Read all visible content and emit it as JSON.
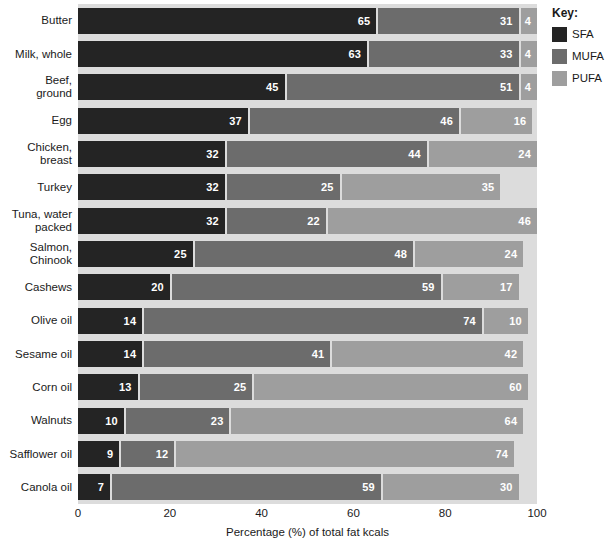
{
  "chart_data": {
    "type": "bar",
    "subtype": "stacked-horizontal-bar",
    "title": "",
    "xlabel": "Percentage (%) of total fat kcals",
    "ylabel": "",
    "xlim": [
      0,
      100
    ],
    "xticks": [
      0,
      20,
      40,
      60,
      80,
      100
    ],
    "xtick_labels": [
      "0",
      "20",
      "40",
      "60",
      "80",
      "100"
    ],
    "grid": false,
    "legend_position": "right",
    "legend_title": "Key:",
    "series": [
      {
        "name": "SFA",
        "color": "#242424",
        "values": [
          65,
          63,
          45,
          37,
          32,
          32,
          32,
          25,
          20,
          14,
          14,
          13,
          10,
          9,
          7
        ]
      },
      {
        "name": "MUFA",
        "color": "#6c6c6c",
        "values": [
          31,
          33,
          51,
          46,
          44,
          25,
          22,
          48,
          59,
          74,
          41,
          25,
          23,
          12,
          59
        ]
      },
      {
        "name": "PUFA",
        "color": "#9e9e9e",
        "values": [
          4,
          4,
          4,
          16,
          24,
          35,
          46,
          24,
          17,
          10,
          42,
          60,
          64,
          74,
          30
        ]
      }
    ],
    "categories": [
      "Butter",
      "Milk, whole",
      "Beef,\nground",
      "Egg",
      "Chicken,\nbreast",
      "Turkey",
      "Tuna, water\npacked",
      "Salmon,\nChinook",
      "Cashews",
      "Olive oil",
      "Sesame oil",
      "Corn oil",
      "Walnuts",
      "Safflower oil",
      "Canola oil"
    ],
    "rows": [
      {
        "category": "Butter",
        "SFA": 65,
        "MUFA": 31,
        "PUFA": 4
      },
      {
        "category": "Milk, whole",
        "SFA": 63,
        "MUFA": 33,
        "PUFA": 4
      },
      {
        "category": "Beef,\nground",
        "SFA": 45,
        "MUFA": 51,
        "PUFA": 4
      },
      {
        "category": "Egg",
        "SFA": 37,
        "MUFA": 46,
        "PUFA": 16
      },
      {
        "category": "Chicken,\nbreast",
        "SFA": 32,
        "MUFA": 44,
        "PUFA": 24
      },
      {
        "category": "Turkey",
        "SFA": 32,
        "MUFA": 25,
        "PUFA": 35
      },
      {
        "category": "Tuna, water\npacked",
        "SFA": 32,
        "MUFA": 22,
        "PUFA": 46
      },
      {
        "category": "Salmon,\nChinook",
        "SFA": 25,
        "MUFA": 48,
        "PUFA": 24
      },
      {
        "category": "Cashews",
        "SFA": 20,
        "MUFA": 59,
        "PUFA": 17
      },
      {
        "category": "Olive oil",
        "SFA": 14,
        "MUFA": 74,
        "PUFA": 10
      },
      {
        "category": "Sesame oil",
        "SFA": 14,
        "MUFA": 41,
        "PUFA": 42
      },
      {
        "category": "Corn oil",
        "SFA": 13,
        "MUFA": 25,
        "PUFA": 60
      },
      {
        "category": "Walnuts",
        "SFA": 10,
        "MUFA": 23,
        "PUFA": 64
      },
      {
        "category": "Safflower oil",
        "SFA": 9,
        "MUFA": 12,
        "PUFA": 74
      },
      {
        "category": "Canola oil",
        "SFA": 7,
        "MUFA": 59,
        "PUFA": 30
      }
    ]
  },
  "legend": {
    "title": "Key:",
    "items": [
      {
        "label": "SFA",
        "color": "#242424"
      },
      {
        "label": "MUFA",
        "color": "#6c6c6c"
      },
      {
        "label": "PUFA",
        "color": "#9e9e9e"
      }
    ]
  },
  "axis": {
    "x_title": "Percentage (%) of total fat kcals",
    "x_tick_labels": [
      "0",
      "20",
      "40",
      "60",
      "80",
      "100"
    ]
  },
  "colors": {
    "sfa": "#242424",
    "mufa": "#6c6c6c",
    "pufa": "#9e9e9e",
    "plot_background": "#dcdcdc",
    "page_background": "#ffffff",
    "text": "#1a1a1a"
  }
}
